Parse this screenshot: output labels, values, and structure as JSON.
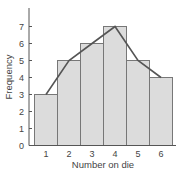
{
  "chart_data": {
    "type": "bar",
    "title": "",
    "xlabel": "Number on die",
    "ylabel": "Frequency",
    "categories": [
      "1",
      "2",
      "3",
      "4",
      "5",
      "6"
    ],
    "values": [
      3,
      5,
      6,
      7,
      5,
      4
    ],
    "overlay": {
      "type": "line",
      "name": "frequency polygon",
      "values": [
        3,
        5,
        6,
        7,
        5,
        4
      ]
    },
    "ylim": [
      0,
      7.5
    ],
    "yticks": [
      0,
      1,
      2,
      3,
      4,
      5,
      6,
      7
    ],
    "grid": false,
    "legend": null,
    "colors": {
      "bar_fill": "#dcdcdc",
      "bar_edge": "#777777",
      "line": "#555555",
      "axis": "#555555"
    }
  }
}
